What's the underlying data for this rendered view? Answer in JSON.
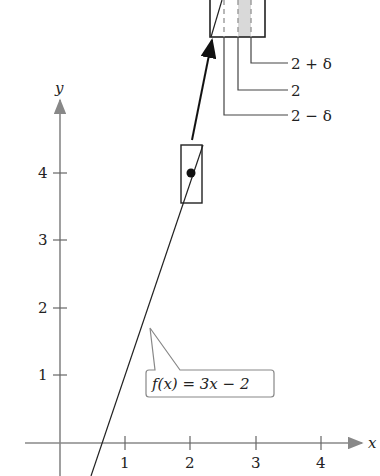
{
  "diagram": {
    "function_label": "f(x) = 3x − 2",
    "x_axis_label": "x",
    "y_axis_label": "y",
    "x_ticks": [
      "1",
      "2",
      "3",
      "4"
    ],
    "y_ticks": [
      "1",
      "2",
      "3",
      "4"
    ],
    "delta_labels": {
      "upper": "2 + δ",
      "center": "2",
      "lower": "2 − δ"
    },
    "highlighted_point": {
      "x": 2,
      "y": 4
    },
    "colors": {
      "axis": "#777777",
      "line": "#222222",
      "shade": "#d9d9d9",
      "label_box_border": "#888888"
    }
  }
}
